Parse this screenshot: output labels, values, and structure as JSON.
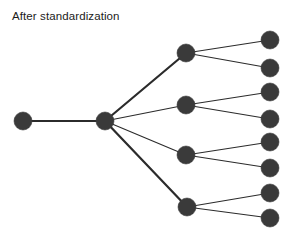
{
  "figure": {
    "title": "After standardization",
    "width": 297,
    "height": 242,
    "background_color": "#ffffff",
    "title_color": "#1b1b1b"
  },
  "chart_data": {
    "type": "diagram",
    "diagram_type": "node-link-tree",
    "title": "After standardization",
    "xlabel": "",
    "ylabel": "",
    "grid": false,
    "legend": null,
    "axis_visible": false,
    "node_style": {
      "shape": "circle",
      "fill": "#3a3a3a",
      "stroke": "#3a3a3a",
      "radius": 9
    },
    "edge_style": {
      "color": "#2b2b2b",
      "thin_width": 1.1,
      "thick_width": 2.2
    },
    "levels": [
      {
        "name": "root",
        "count": 1,
        "x": 23
      },
      {
        "name": "hub",
        "count": 1,
        "x": 105
      },
      {
        "name": "branch",
        "count": 4,
        "x": 186
      },
      {
        "name": "leaf",
        "count": 8,
        "x": 270
      }
    ],
    "nodes": [
      {
        "id": "root",
        "level": 0,
        "x": 23,
        "y": 121,
        "r": 9
      },
      {
        "id": "hub",
        "level": 1,
        "x": 105,
        "y": 121,
        "r": 9
      },
      {
        "id": "b1",
        "level": 2,
        "x": 186,
        "y": 53,
        "r": 9
      },
      {
        "id": "b2",
        "level": 2,
        "x": 186,
        "y": 105,
        "r": 9
      },
      {
        "id": "b3",
        "level": 2,
        "x": 186,
        "y": 155,
        "r": 9
      },
      {
        "id": "b4",
        "level": 2,
        "x": 187,
        "y": 207,
        "r": 9
      },
      {
        "id": "l1",
        "level": 3,
        "x": 270,
        "y": 40,
        "r": 9
      },
      {
        "id": "l2",
        "level": 3,
        "x": 270,
        "y": 68,
        "r": 9
      },
      {
        "id": "l3",
        "level": 3,
        "x": 270,
        "y": 92,
        "r": 9
      },
      {
        "id": "l4",
        "level": 3,
        "x": 270,
        "y": 119,
        "r": 9
      },
      {
        "id": "l5",
        "level": 3,
        "x": 270,
        "y": 142,
        "r": 9
      },
      {
        "id": "l6",
        "level": 3,
        "x": 270,
        "y": 168,
        "r": 9
      },
      {
        "id": "l7",
        "level": 3,
        "x": 270,
        "y": 193,
        "r": 9
      },
      {
        "id": "l8",
        "level": 3,
        "x": 270,
        "y": 218,
        "r": 9
      }
    ],
    "edges": [
      {
        "from": "root",
        "to": "hub",
        "width": 2.2
      },
      {
        "from": "hub",
        "to": "b1",
        "width": 2.2
      },
      {
        "from": "hub",
        "to": "b2",
        "width": 1.1
      },
      {
        "from": "hub",
        "to": "b3",
        "width": 1.1
      },
      {
        "from": "hub",
        "to": "b4",
        "width": 2.2
      },
      {
        "from": "b1",
        "to": "l1",
        "width": 1.1
      },
      {
        "from": "b1",
        "to": "l2",
        "width": 1.1
      },
      {
        "from": "b2",
        "to": "l3",
        "width": 1.1
      },
      {
        "from": "b2",
        "to": "l4",
        "width": 1.1
      },
      {
        "from": "b3",
        "to": "l5",
        "width": 1.1
      },
      {
        "from": "b3",
        "to": "l6",
        "width": 1.1
      },
      {
        "from": "b4",
        "to": "l7",
        "width": 1.1
      },
      {
        "from": "b4",
        "to": "l8",
        "width": 1.1
      }
    ]
  }
}
